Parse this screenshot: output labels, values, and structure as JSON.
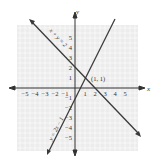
{
  "figure": {
    "type": "coordinate-plane-graph",
    "colors": {
      "background": "#ffffff",
      "grid_fill": "#ececec",
      "grid_lines": "#ffffff",
      "axes": "#333333",
      "lines": "#3a3a3a",
      "text": "#333333"
    },
    "axes": {
      "x_label": "x",
      "y_label": "y",
      "x_ticks": [
        {
          "value": -5,
          "label": "−5"
        },
        {
          "value": -4,
          "label": "−4"
        },
        {
          "value": -3,
          "label": "−3"
        },
        {
          "value": -2,
          "label": "−2"
        },
        {
          "value": -1,
          "label": "−1"
        },
        {
          "value": 1,
          "label": "1"
        },
        {
          "value": 2,
          "label": "2"
        },
        {
          "value": 3,
          "label": "3"
        },
        {
          "value": 4,
          "label": "4"
        },
        {
          "value": 5,
          "label": "5"
        }
      ],
      "y_ticks": [
        {
          "value": 5,
          "label": "5"
        },
        {
          "value": 4,
          "label": "4"
        },
        {
          "value": 3,
          "label": "3"
        },
        {
          "value": 2,
          "label": "2"
        },
        {
          "value": 1,
          "label": "1"
        },
        {
          "value": -1,
          "label": "−1"
        },
        {
          "value": -2,
          "label": "−2"
        },
        {
          "value": -3,
          "label": "−3"
        },
        {
          "value": -4,
          "label": "−4"
        },
        {
          "value": -5,
          "label": "−5"
        }
      ]
    },
    "lines": [
      {
        "name": "line-x-plus-y-eq-2",
        "label": "x + y = 2",
        "equation": "x + y = 2"
      },
      {
        "name": "line-y-eq-2x-minus-1",
        "label": "y = 2x − 1",
        "equation": "y = 2x − 1"
      }
    ],
    "intersection": {
      "label": "(1, 1)",
      "x": 1,
      "y": 1
    }
  }
}
